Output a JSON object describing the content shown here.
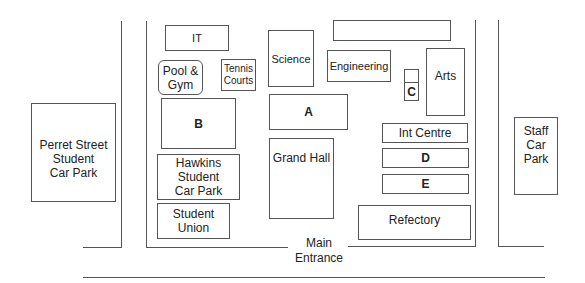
{
  "map": {
    "buildings": {
      "it": "IT",
      "pool_gym": "Pool &\nGym",
      "tennis": "Tennis\nCourts",
      "science": "Science",
      "unnamed_top": "",
      "engineering": "Engineering",
      "c_upper": "",
      "c": "C",
      "arts": "Arts",
      "a": "A",
      "b": "B",
      "int_centre": "Int Centre",
      "d": "D",
      "e": "E",
      "grand_hall": "Grand Hall",
      "hawkins": "Hawkins\nStudent\nCar Park",
      "student_union": "Student\nUnion",
      "refectory": "Refectory",
      "perret": "Perret Street\nStudent\nCar Park",
      "staff": "Staff\nCar\nPark"
    },
    "entrance_label": "Main\nEntrance"
  }
}
